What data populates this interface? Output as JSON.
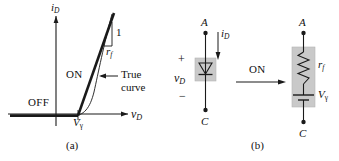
{
  "figure": {
    "panel_a": {
      "caption": "(a)",
      "y_axis_label": "i",
      "y_axis_sub": "D",
      "x_axis_label": "v",
      "x_axis_sub": "D",
      "region_off": "OFF",
      "region_on": "ON",
      "annotation_true_line1": "True",
      "annotation_true_line2": "curve",
      "slope_rise": "1",
      "slope_run": "r",
      "slope_run_sub": "f",
      "threshold_label": "V",
      "threshold_sub": "γ"
    },
    "panel_b": {
      "caption": "(b)",
      "transition_label": "ON",
      "left_circuit": {
        "node_top": "A",
        "node_bottom": "C",
        "current_label": "i",
        "current_sub": "D",
        "voltage_label": "v",
        "voltage_sub": "D",
        "polarity_plus": "+",
        "polarity_minus": "−",
        "element": "diode-symbol"
      },
      "right_circuit": {
        "node_top": "A",
        "node_bottom": "C",
        "resistor_label": "r",
        "resistor_sub": "f",
        "source_label": "V",
        "source_sub": "γ",
        "elements": [
          "resistor",
          "battery"
        ]
      }
    },
    "colors": {
      "line": "#1a1a1a",
      "shade": "#c9c9c9",
      "shade_border": "#b4b4b4",
      "background": "#ffffff"
    }
  }
}
